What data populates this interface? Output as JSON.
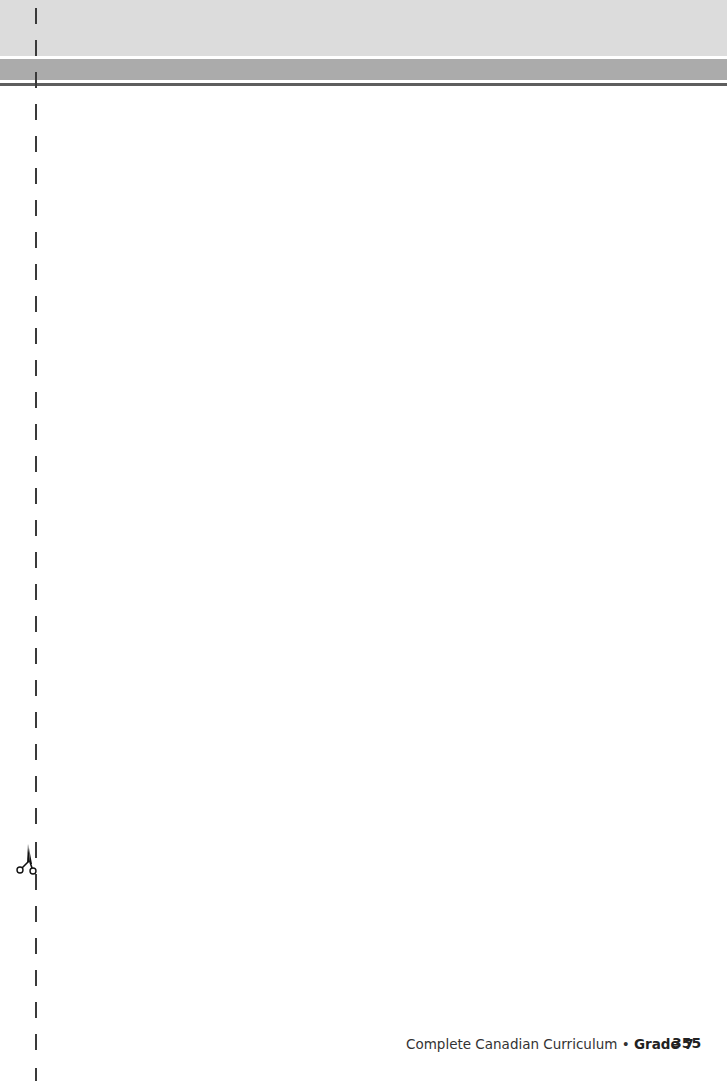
{
  "header": {
    "top_band_color": "#dcdcdc",
    "mid_band_color": "#ababab",
    "rule_color": "#5e5e5e"
  },
  "cut_line": {
    "icon": "scissors-icon",
    "dash_color": "#3a3a3a"
  },
  "footer": {
    "book_title": "Complete Canadian Curriculum",
    "separator": "•",
    "grade": "Grade 7",
    "page_number": "355"
  }
}
